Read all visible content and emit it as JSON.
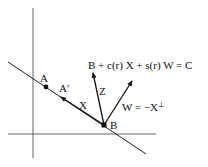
{
  "diagram": {
    "type": "geometric-vector-diagram",
    "axes": {
      "vertical": {
        "x": 33,
        "y1": 8,
        "y2": 158
      },
      "horizontal": {
        "y": 134,
        "x1": 8,
        "x2": 156
      }
    },
    "line": {
      "x1": 8,
      "y1": 62,
      "x2": 146,
      "y2": 154
    },
    "points": {
      "A": {
        "label": "A",
        "x": 46,
        "y": 87
      },
      "B": {
        "label": "B",
        "x": 104,
        "y": 125
      }
    },
    "vectors": {
      "X": {
        "label": "X",
        "to_label": "A′",
        "tip": {
          "x": 61,
          "y": 97
        }
      },
      "Z": {
        "label": "Z",
        "tip": {
          "x": 93,
          "y": 73
        }
      },
      "W": {
        "label": "W = −X",
        "superscript": "⊥",
        "tip": {
          "x": 132,
          "y": 81
        }
      }
    },
    "equation": {
      "text": "B + c(r) X + s(r) W = C"
    },
    "colors": {
      "ink": "#111111",
      "axis": "#555555",
      "background": "#ffffff"
    }
  }
}
